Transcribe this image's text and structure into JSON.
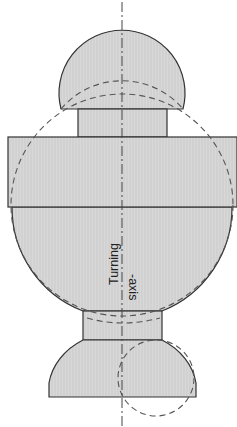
{
  "diagram": {
    "type": "turned-part-cross-section",
    "labels": {
      "axis_line1": "Turning",
      "axis_line2": "-axis"
    },
    "colors": {
      "fill": "#d6d6d6",
      "outline": "#333333",
      "dashed": "#555555",
      "background": "#ffffff"
    },
    "parts": [
      {
        "name": "top-dome",
        "shape": "spherical segment"
      },
      {
        "name": "top-neck",
        "shape": "cylinder"
      },
      {
        "name": "flange",
        "shape": "wide cylinder"
      },
      {
        "name": "main-body",
        "shape": "spherical body"
      },
      {
        "name": "bottom-neck",
        "shape": "cylinder"
      },
      {
        "name": "bottom-cap",
        "shape": "spherical segment"
      }
    ],
    "construction_circles": [
      {
        "name": "large-sphere",
        "style": "dashed"
      },
      {
        "name": "top-dome-lower-arc",
        "style": "dashed"
      },
      {
        "name": "small-sphere",
        "style": "dashed"
      }
    ]
  }
}
